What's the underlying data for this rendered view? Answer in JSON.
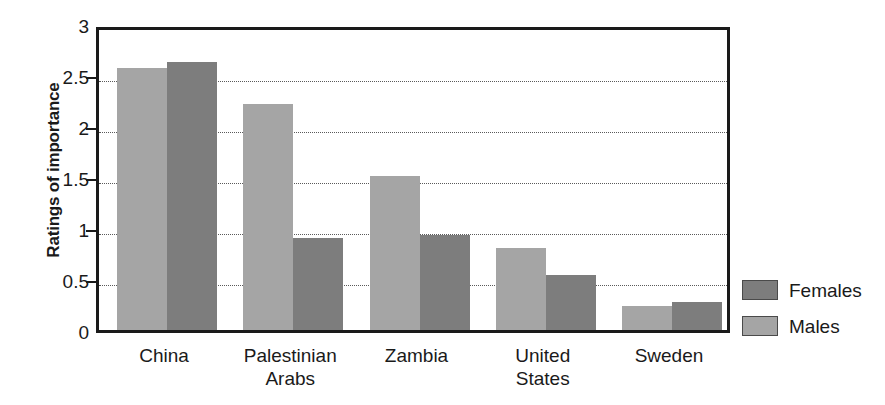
{
  "chart_data": {
    "type": "bar",
    "title": "",
    "subtitle": "",
    "xlabel": "",
    "ylabel": "Ratings of importance",
    "ylim": [
      0,
      3
    ],
    "ytick_values": [
      0,
      0.5,
      1,
      1.5,
      2,
      2.5,
      3
    ],
    "ytick_labels": [
      "0",
      "0.5",
      "1",
      "1.5",
      "2",
      "2.5",
      "3"
    ],
    "grid": "horizontal-dotted",
    "legend_position": "right",
    "categories": [
      "China",
      "Palestinian\nArabs",
      "Zambia",
      "United\nStates",
      "Sweden"
    ],
    "series": [
      {
        "name": "Males",
        "color": "#a5a5a5",
        "values": [
          2.6,
          2.25,
          1.54,
          0.83,
          0.26
        ]
      },
      {
        "name": "Females",
        "color": "#7d7d7d",
        "values": [
          2.66,
          0.93,
          0.96,
          0.57,
          0.3
        ]
      }
    ],
    "series_draw_order": [
      "Males",
      "Females"
    ]
  },
  "legend": {
    "entries": [
      {
        "label": "Females",
        "color": "#7d7d7d"
      },
      {
        "label": "Males",
        "color": "#a5a5a5"
      }
    ]
  },
  "colors": {
    "males": "#a5a5a5",
    "females": "#7d7d7d",
    "axis": "#1a1a1a",
    "gridline": "#5a5a5a",
    "background": "#ffffff"
  }
}
